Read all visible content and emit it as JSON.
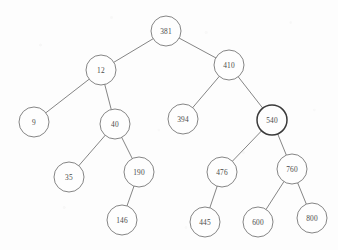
{
  "figure": {
    "background_color": "#fdfdfd",
    "stroke_color": "#6f6f6f",
    "label_color": "#4a4a4a",
    "emphasis_stroke_color": "#3a3a3a",
    "width": 338,
    "height": 250
  },
  "chart_data": {
    "type": "diagram",
    "diagram_type": "binary-search-tree",
    "title": "",
    "node_radius": 15,
    "nodes": [
      {
        "id": "n381",
        "label": "381",
        "x": 166,
        "y": 31,
        "depth": 0,
        "emphasis": false
      },
      {
        "id": "n12",
        "label": "12",
        "x": 101,
        "y": 70,
        "depth": 1,
        "emphasis": false
      },
      {
        "id": "n410",
        "label": "410",
        "x": 229,
        "y": 65,
        "depth": 1,
        "emphasis": false
      },
      {
        "id": "n9",
        "label": "9",
        "x": 34,
        "y": 122,
        "depth": 2,
        "emphasis": false
      },
      {
        "id": "n40",
        "label": "40",
        "x": 115,
        "y": 124,
        "depth": 2,
        "emphasis": false
      },
      {
        "id": "n394",
        "label": "394",
        "x": 183,
        "y": 119,
        "depth": 2,
        "emphasis": false
      },
      {
        "id": "n540",
        "label": "540",
        "x": 272,
        "y": 120,
        "depth": 2,
        "emphasis": true
      },
      {
        "id": "n35",
        "label": "35",
        "x": 69,
        "y": 177,
        "depth": 3,
        "emphasis": false
      },
      {
        "id": "n190",
        "label": "190",
        "x": 139,
        "y": 172,
        "depth": 3,
        "emphasis": false
      },
      {
        "id": "n476",
        "label": "476",
        "x": 222,
        "y": 172,
        "depth": 3,
        "emphasis": false
      },
      {
        "id": "n760",
        "label": "760",
        "x": 292,
        "y": 169,
        "depth": 3,
        "emphasis": false
      },
      {
        "id": "n146",
        "label": "146",
        "x": 122,
        "y": 220,
        "depth": 4,
        "emphasis": false
      },
      {
        "id": "n445",
        "label": "445",
        "x": 205,
        "y": 222,
        "depth": 4,
        "emphasis": false
      },
      {
        "id": "n600",
        "label": "600",
        "x": 258,
        "y": 222,
        "depth": 4,
        "emphasis": false
      },
      {
        "id": "n800",
        "label": "800",
        "x": 312,
        "y": 218,
        "depth": 4,
        "emphasis": false
      }
    ],
    "edges": [
      {
        "from": "n381",
        "to": "n12",
        "side": "left"
      },
      {
        "from": "n381",
        "to": "n410",
        "side": "right"
      },
      {
        "from": "n12",
        "to": "n9",
        "side": "left"
      },
      {
        "from": "n12",
        "to": "n40",
        "side": "right"
      },
      {
        "from": "n40",
        "to": "n35",
        "side": "left"
      },
      {
        "from": "n40",
        "to": "n190",
        "side": "right"
      },
      {
        "from": "n190",
        "to": "n146",
        "side": "left"
      },
      {
        "from": "n410",
        "to": "n394",
        "side": "left"
      },
      {
        "from": "n410",
        "to": "n540",
        "side": "right"
      },
      {
        "from": "n540",
        "to": "n476",
        "side": "left"
      },
      {
        "from": "n540",
        "to": "n760",
        "side": "right"
      },
      {
        "from": "n476",
        "to": "n445",
        "side": "left"
      },
      {
        "from": "n760",
        "to": "n600",
        "side": "left"
      },
      {
        "from": "n760",
        "to": "n800",
        "side": "right"
      }
    ]
  }
}
